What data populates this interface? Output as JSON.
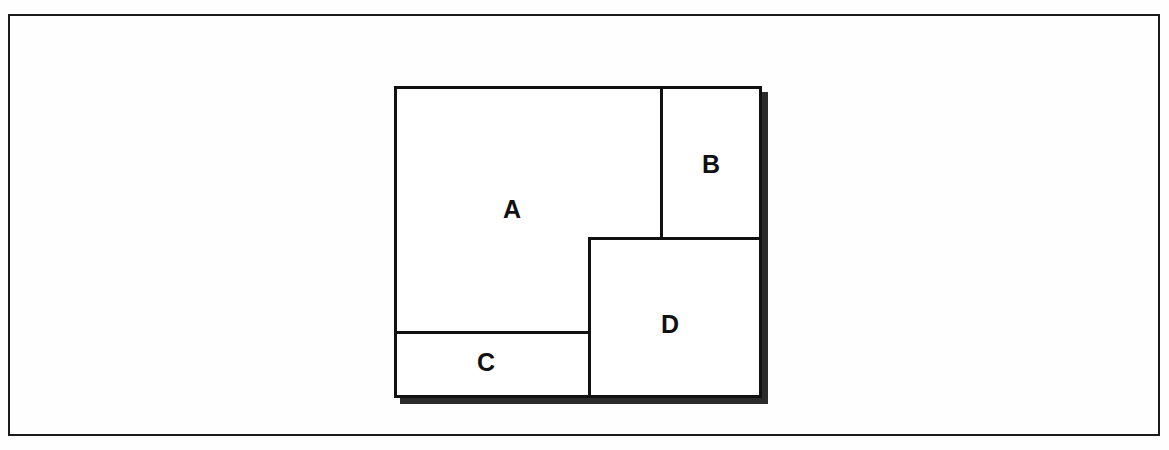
{
  "figure": {
    "background_color": "#fefefe",
    "line_color": "#111111",
    "shadow_color": "#2b2b2b",
    "frame": {
      "name": "outer-frame",
      "border_color": "#1a1a1a",
      "border_width_px": 2
    }
  },
  "diagram": {
    "name": "partitioned-block",
    "border_color": "#111111",
    "border_width_px": 3,
    "has_drop_shadow": true,
    "shadow_offset_px": 6,
    "regions": [
      {
        "id": "region-a",
        "label": "A",
        "label_x_pct": 32,
        "label_y_pct": 39
      },
      {
        "id": "region-b",
        "label": "B",
        "label_x_pct": 85,
        "label_y_pct": 25
      },
      {
        "id": "region-c",
        "label": "C",
        "label_x_pct": 25,
        "label_y_pct": 92
      },
      {
        "id": "region-d",
        "label": "D",
        "label_x_pct": 78,
        "label_y_pct": 76
      }
    ],
    "dividers": [
      {
        "id": "divider-ab",
        "orientation": "vertical"
      },
      {
        "id": "divider-bd",
        "orientation": "horizontal"
      },
      {
        "id": "divider-ac",
        "orientation": "horizontal"
      },
      {
        "id": "divider-cd",
        "orientation": "vertical"
      }
    ]
  }
}
